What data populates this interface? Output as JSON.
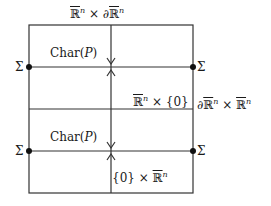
{
  "diagram": {
    "labels": {
      "top_boundary": {
        "r1": "ℝ",
        "n1": "n",
        "times": " × ∂",
        "r2": "ℝ",
        "n2": "n"
      },
      "mid_boundary_left": {
        "r": "ℝ",
        "n": "n",
        "rest": " × {0}"
      },
      "mid_boundary_right": {
        "d": "∂",
        "r1": "ℝ",
        "n1": "n",
        "times": " × ",
        "r2": "ℝ",
        "n2": "n"
      },
      "bottom_label": {
        "pre": "{0} × ",
        "r": "ℝ",
        "n": "n"
      },
      "char_upper": {
        "pre": "Char(",
        "p": "P",
        "post": ")"
      },
      "char_lower": {
        "pre": "Char(",
        "p": "P",
        "post": ")"
      },
      "sigma_ul": "Σ",
      "sigma_ur": "Σ",
      "sigma_ll": "Σ",
      "sigma_lr": "Σ"
    }
  }
}
